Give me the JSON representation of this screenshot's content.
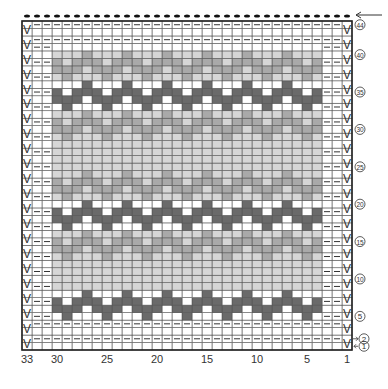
{
  "chart_data": {
    "type": "heatmap",
    "title": "",
    "columns": 33,
    "rows": 44,
    "x_tick_labels": [
      "33",
      "30",
      "25",
      "20",
      "15",
      "10",
      "5",
      "1"
    ],
    "x_tick_positions": [
      33,
      30,
      25,
      20,
      15,
      10,
      5,
      1
    ],
    "row_markers": [
      "44",
      "40",
      "35",
      "30",
      "25",
      "20",
      "15",
      "10",
      "5",
      "2",
      "1"
    ],
    "row_marker_positions": [
      44,
      40,
      35,
      30,
      25,
      20,
      15,
      10,
      5,
      2,
      1
    ],
    "colors": {
      "white": "#ffffff",
      "light": "#d6d6d6",
      "medium": "#a9a9a9",
      "dark": "#6a6a6a",
      "grid": "#555555",
      "border": "#222222"
    },
    "symbols": {
      "slip": "V",
      "purl": "—",
      "bind_off_dot": "•"
    },
    "legend": [
      {
        "symbol": "V",
        "meaning": "slip stitch"
      },
      {
        "symbol": "—",
        "meaning": "purl"
      },
      {
        "symbol": "white",
        "meaning": "main color"
      },
      {
        "symbol": "light",
        "meaning": "contrast color 1"
      },
      {
        "symbol": "medium",
        "meaning": "contrast color 2"
      },
      {
        "symbol": "dark",
        "meaning": "contrast color 3"
      }
    ],
    "bands": [
      {
        "rows": [
          5,
          8
        ],
        "shade": "dark"
      },
      {
        "rows": [
          9,
          12
        ],
        "shade": "light"
      },
      {
        "rows": [
          13,
          16
        ],
        "shade": "medium"
      },
      {
        "rows": [
          17,
          20
        ],
        "shade": "dark"
      },
      {
        "rows": [
          21,
          24
        ],
        "shade": "medium"
      },
      {
        "rows": [
          25,
          28
        ],
        "shade": "light"
      },
      {
        "rows": [
          29,
          32
        ],
        "shade": "medium"
      },
      {
        "rows": [
          33,
          36
        ],
        "shade": "dark"
      },
      {
        "rows": [
          37,
          40
        ],
        "shade": "medium"
      }
    ],
    "motif_repeat_stitches": 4,
    "motif_columns": [
      4,
      30
    ],
    "start_arrow_row": 44,
    "row_arrows": [
      "2",
      "1"
    ]
  }
}
